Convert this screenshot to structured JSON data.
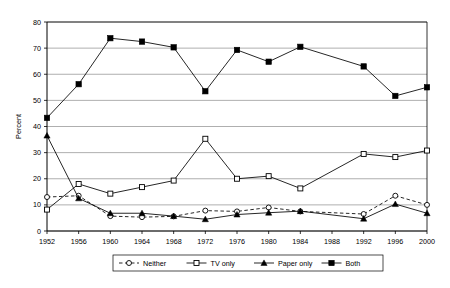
{
  "chart_data": {
    "type": "line",
    "title": "",
    "xlabel": "",
    "ylabel": "Percent",
    "ylim": [
      0,
      80
    ],
    "ytick_step": 10,
    "yticks": [
      0,
      10,
      20,
      30,
      40,
      50,
      60,
      70,
      80
    ],
    "xticks": [
      1952,
      1956,
      1960,
      1964,
      1968,
      1972,
      1976,
      1980,
      1984,
      1988,
      1992,
      1996,
      2000
    ],
    "x": [
      1952,
      1956,
      1960,
      1964,
      1968,
      1972,
      1976,
      1980,
      1984,
      1992,
      1996,
      2000
    ],
    "grid": "horizontal",
    "legend_position": "bottom",
    "series": [
      {
        "name": "Neither",
        "marker": "open-circle",
        "line": "dashed",
        "color": "#000000",
        "values": [
          13,
          13.5,
          5.7,
          5.3,
          5.6,
          7.8,
          7.5,
          9,
          7.5,
          6.5,
          13.5,
          10
        ]
      },
      {
        "name": "TV only",
        "marker": "open-square",
        "line": "solid",
        "color": "#000000",
        "values": [
          8.2,
          18,
          14.3,
          16.8,
          19.3,
          35.3,
          20,
          21,
          16.3,
          29.5,
          28.3,
          30.8
        ]
      },
      {
        "name": "Paper only",
        "marker": "filled-triangle",
        "line": "solid",
        "color": "#000000",
        "values": [
          36.5,
          12.5,
          6.8,
          6.8,
          5.7,
          4.5,
          6.3,
          7,
          7.6,
          4.7,
          10.3,
          6.8
        ]
      },
      {
        "name": "Both",
        "marker": "filled-square",
        "line": "solid",
        "color": "#000000",
        "values": [
          43.3,
          56.2,
          73.8,
          72.5,
          70.3,
          53.5,
          69.3,
          64.8,
          70.5,
          63,
          51.7,
          55
        ]
      }
    ]
  },
  "legend": {
    "items": [
      {
        "label": "Neither"
      },
      {
        "label": "TV only"
      },
      {
        "label": "Paper only"
      },
      {
        "label": "Both"
      }
    ]
  }
}
